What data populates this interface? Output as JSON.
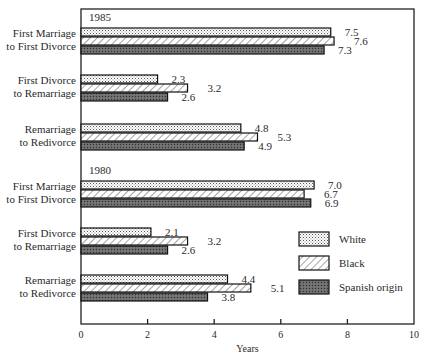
{
  "chart_data": {
    "type": "bar",
    "orientation": "horizontal",
    "title": "",
    "xlabel": "Years",
    "ylabel": "",
    "xlim": [
      0,
      10
    ],
    "x_ticks": [
      0,
      2,
      4,
      6,
      8,
      10
    ],
    "grid": false,
    "legend_position": "lower right inside",
    "legend": [
      {
        "name": "White",
        "pattern": "dots"
      },
      {
        "name": "Black",
        "pattern": "diagonal-hatch"
      },
      {
        "name": "Spanish origin",
        "pattern": "dark-crosshatch"
      }
    ],
    "panels": [
      {
        "label": "1985",
        "categories": [
          "First Marriage\nto First Divorce",
          "First Divorce\nto Remarriage",
          "Remarriage\nto Redivorce"
        ],
        "series": [
          {
            "name": "White",
            "values": [
              7.5,
              2.3,
              4.8
            ]
          },
          {
            "name": "Black",
            "values": [
              7.6,
              3.2,
              5.3
            ]
          },
          {
            "name": "Spanish origin",
            "values": [
              7.3,
              2.6,
              4.9
            ]
          }
        ]
      },
      {
        "label": "1980",
        "categories": [
          "First Marriage\nto First Divorce",
          "First Divorce\nto Remarriage",
          "Remarriage\nto Redivorce"
        ],
        "series": [
          {
            "name": "White",
            "values": [
              7.0,
              2.1,
              4.4
            ]
          },
          {
            "name": "Black",
            "values": [
              6.7,
              3.2,
              5.1
            ]
          },
          {
            "name": "Spanish origin",
            "values": [
              6.9,
              2.6,
              3.8
            ]
          }
        ]
      }
    ]
  },
  "layout": {
    "plot": {
      "x0": 81,
      "x1": 414,
      "y0": 9,
      "y1": 324
    },
    "groups_top": [
      28,
      75,
      124,
      181,
      228,
      275
    ],
    "bar_height": 8,
    "bar_gap": 9,
    "panel_labels_y": [
      21,
      174
    ],
    "legend": {
      "x": 299,
      "y": 232,
      "box_w": 30,
      "box_h": 14,
      "row_gap": 24
    }
  }
}
